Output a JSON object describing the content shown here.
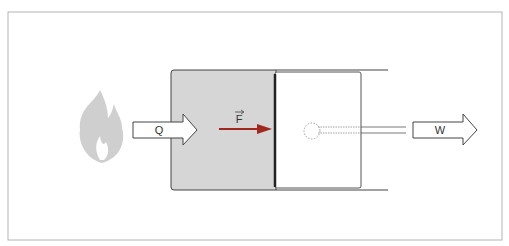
{
  "diagram": {
    "labels": {
      "heat": "Q",
      "force": "F",
      "work": "W"
    },
    "colors": {
      "gas": "#d4d4d4",
      "force_arrow": "#a0281e",
      "flame": "#cfcfcf",
      "frame": "#b4b4b4",
      "line": "#333333"
    }
  }
}
